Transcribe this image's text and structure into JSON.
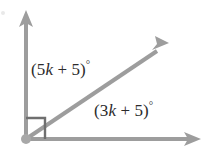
{
  "figure": {
    "background_color": "#ffffff",
    "ray_color": "#9d9d9d",
    "marker_color": "#6f6f6f",
    "text_color": "#2b2b2b",
    "vertex": {
      "x": 26,
      "y": 139
    },
    "rays": [
      {
        "name": "vertical-ray",
        "from_x": 26,
        "from_y": 139,
        "to_x": 26,
        "to_y": 12,
        "arrowhead": true
      },
      {
        "name": "diagonal-ray",
        "from_x": 26,
        "from_y": 139,
        "to_x": 166,
        "to_y": 45,
        "arrowhead": true
      },
      {
        "name": "horizontal-ray",
        "from_x": 26,
        "from_y": 139,
        "to_x": 198,
        "to_y": 139,
        "arrowhead": true
      }
    ],
    "right_angle_marker": {
      "x": 26,
      "y": 118,
      "width": 19,
      "height": 21
    },
    "labels": {
      "upper": {
        "open_paren": "(",
        "coefficient": "5",
        "variable": "k",
        "operator": " + ",
        "constant": "5",
        "close_paren": ")",
        "degree": "°",
        "full_text": "(5k + 5)°"
      },
      "lower": {
        "open_paren": "(",
        "coefficient": "3",
        "variable": "k",
        "operator": " + ",
        "constant": "5",
        "close_paren": ")",
        "degree": "°",
        "full_text": "(3k + 5)°"
      }
    }
  }
}
